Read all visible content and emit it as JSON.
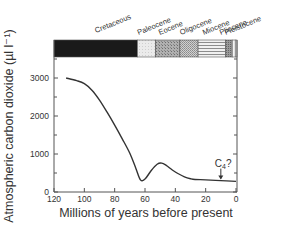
{
  "chart_data": {
    "type": "line",
    "title": "",
    "xlabel": "Millions of years before present",
    "ylabel": "Atmospheric carbon dioxide (µl l⁻¹)",
    "xlim": [
      120,
      0
    ],
    "ylim": [
      0,
      3500
    ],
    "x_ticks": [
      120,
      100,
      80,
      60,
      40,
      20,
      0
    ],
    "y_ticks": [
      0,
      1000,
      2000,
      3000
    ],
    "y_minor_ticks": [
      500,
      1500,
      2500,
      3500
    ],
    "grid": false,
    "legend": null,
    "series": [
      {
        "name": "Atmospheric CO2",
        "x": [
          112,
          105,
          100,
          95,
          90,
          85,
          80,
          75,
          70,
          66,
          63,
          60,
          56,
          52,
          49,
          46,
          42,
          38,
          34,
          30,
          27,
          20,
          10,
          0
        ],
        "y": [
          3000,
          2930,
          2850,
          2680,
          2420,
          2100,
          1760,
          1400,
          1020,
          620,
          320,
          340,
          560,
          730,
          760,
          700,
          580,
          480,
          400,
          350,
          330,
          320,
          300,
          280
        ]
      }
    ],
    "annotations": [
      {
        "text": "C4?",
        "x": 10,
        "y": 300,
        "arrow": "down"
      }
    ],
    "periods": [
      {
        "name": "Cretaceous",
        "start": 120,
        "end": 65,
        "fill": "#1a1a1a"
      },
      {
        "name": "Paleocene",
        "start": 65,
        "end": 53,
        "fill": "#e6e6e6"
      },
      {
        "name": "Eocene",
        "start": 53,
        "end": 37,
        "fill": "#a9a9a9"
      },
      {
        "name": "Oligocene",
        "start": 37,
        "end": 25,
        "fill": "#c4c4c4"
      },
      {
        "name": "Miocene",
        "start": 25,
        "end": 7,
        "fill": "#dcdcdc"
      },
      {
        "name": "Pliocene",
        "start": 7,
        "end": 2.5,
        "fill": "#9e9e9e"
      },
      {
        "name": "Pleistocene",
        "start": 2.5,
        "end": 0.5,
        "fill": "#f4f4f4"
      }
    ]
  }
}
